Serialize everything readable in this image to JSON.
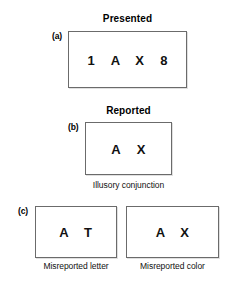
{
  "figure": {
    "background_color": "#ffffff",
    "text_color": "#111111",
    "box_border_color": "#6b6b6b"
  },
  "panel_a": {
    "title": "Presented",
    "label": "(a)",
    "items": [
      {
        "char": "1",
        "color": "#111111"
      },
      {
        "char": "A",
        "color": "#111111"
      },
      {
        "char": "X",
        "color": "#111111"
      },
      {
        "char": "8",
        "color": "#111111"
      }
    ]
  },
  "panel_b": {
    "title": "Reported",
    "label": "(b)",
    "items": [
      {
        "char": "A",
        "color": "#111111"
      },
      {
        "char": "X",
        "color": "#111111"
      }
    ],
    "caption": "Illusory conjunction"
  },
  "panel_c": {
    "label": "(c)",
    "boxes": [
      {
        "items": [
          {
            "char": "A",
            "color": "#111111"
          },
          {
            "char": "T",
            "color": "#111111"
          }
        ],
        "caption": "Misreported letter"
      },
      {
        "items": [
          {
            "char": "A",
            "color": "#111111"
          },
          {
            "char": "X",
            "color": "#111111"
          }
        ],
        "caption": "Misreported color"
      }
    ]
  }
}
